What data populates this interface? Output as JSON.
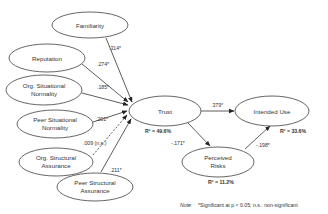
{
  "diagram": {
    "type": "structural-equation-model",
    "nodes": {
      "familiarity": {
        "label": "Familiarity"
      },
      "reputation": {
        "label": "Reputation"
      },
      "org_situational_normality": {
        "line1": "Org. Situational",
        "line2": "Normality"
      },
      "peer_situational_normality": {
        "line1": "Peer Situational",
        "line2": "Normality"
      },
      "org_structural_assurance": {
        "line1": "Org. Structural",
        "line2": "Assurance"
      },
      "peer_structural_assurance": {
        "line1": "Peer Structural",
        "line2": "Assurance"
      },
      "trust": {
        "label": "Trust",
        "r2": "R² = 49.6%"
      },
      "intended_use": {
        "label": "Intended Use",
        "r2": "R² = 33.6%"
      },
      "perceived_risks": {
        "line1": "Perceived",
        "line2": "Risks",
        "r2": "R² = 11.2%"
      }
    },
    "edges": [
      {
        "from": "Familiarity",
        "to": "Trust",
        "coef": ".314*",
        "significant": true
      },
      {
        "from": "Reputation",
        "to": "Trust",
        "coef": ".274*",
        "significant": true
      },
      {
        "from": "Org. Situational Normality",
        "to": "Trust",
        "coef": ".185*",
        "significant": true
      },
      {
        "from": "Peer Situational Normality",
        "to": "Trust",
        "coef": ".201*",
        "significant": true
      },
      {
        "from": "Org. Structural Assurance",
        "to": "Trust",
        "coef": ".009 (n.s.)",
        "significant": false
      },
      {
        "from": "Peer Structural Assurance",
        "to": "Trust",
        "coef": ".211*",
        "significant": true
      },
      {
        "from": "Trust",
        "to": "Intended Use",
        "coef": ".379*",
        "significant": true
      },
      {
        "from": "Trust",
        "to": "Perceived Risks",
        "coef": "-.171*",
        "significant": true
      },
      {
        "from": "Perceived Risks",
        "to": "Intended Use",
        "coef": "-.198*",
        "significant": true
      }
    ],
    "note": {
      "prefix": "Note:",
      "text": "*Significant at p < 0.05; n.s.: non-significant"
    }
  }
}
